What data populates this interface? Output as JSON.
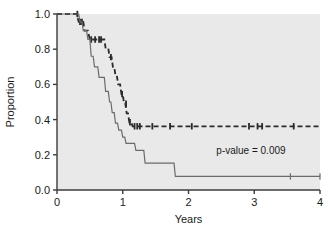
{
  "chart_data": {
    "type": "line",
    "title": "",
    "subtitle": "",
    "xlabel": "Years",
    "ylabel": "Proportion",
    "xlim": [
      0,
      4
    ],
    "ylim": [
      0,
      1
    ],
    "xticks": [
      "0",
      "1",
      "2",
      "3",
      "4"
    ],
    "xtick_values": [
      0,
      1,
      2,
      3,
      4
    ],
    "yticks": [
      "0.0",
      "0.2",
      "0.4",
      "0.6",
      "0.8",
      "1.0"
    ],
    "ytick_values": [
      0,
      0.2,
      0.4,
      0.6,
      0.8,
      1.0
    ],
    "grid": false,
    "legend": "none",
    "plot_background": "#e9e9e9",
    "figure_background": "#ffffff",
    "axis_color": "#3c3c3c",
    "annotations": [
      {
        "name": "p-value-annotation",
        "text": "p-value = 0.009",
        "x": 2.95,
        "y": 0.205
      }
    ],
    "series": [
      {
        "name": "group-upper-dashed",
        "style": "dashed",
        "color": "#2a2a2a",
        "step_points": [
          [
            0.0,
            1.0
          ],
          [
            0.3,
            1.0
          ],
          [
            0.33,
            0.955
          ],
          [
            0.4,
            0.955
          ],
          [
            0.42,
            0.905
          ],
          [
            0.47,
            0.905
          ],
          [
            0.5,
            0.855
          ],
          [
            0.72,
            0.855
          ],
          [
            0.74,
            0.805
          ],
          [
            0.78,
            0.805
          ],
          [
            0.8,
            0.755
          ],
          [
            0.83,
            0.755
          ],
          [
            0.85,
            0.7
          ],
          [
            0.87,
            0.7
          ],
          [
            0.89,
            0.65
          ],
          [
            0.91,
            0.65
          ],
          [
            0.93,
            0.6
          ],
          [
            0.96,
            0.6
          ],
          [
            0.98,
            0.545
          ],
          [
            1.0,
            0.545
          ],
          [
            1.02,
            0.49
          ],
          [
            1.04,
            0.49
          ],
          [
            1.06,
            0.435
          ],
          [
            1.08,
            0.435
          ],
          [
            1.1,
            0.385
          ],
          [
            1.13,
            0.385
          ],
          [
            1.15,
            0.362
          ],
          [
            4.0,
            0.362
          ]
        ],
        "censor_marks": [
          [
            0.31,
            1.0
          ],
          [
            0.35,
            0.955
          ],
          [
            0.38,
            0.955
          ],
          [
            0.52,
            0.855
          ],
          [
            0.58,
            0.855
          ],
          [
            0.64,
            0.855
          ],
          [
            0.67,
            0.855
          ],
          [
            0.82,
            0.755
          ],
          [
            0.99,
            0.545
          ],
          [
            1.05,
            0.49
          ],
          [
            1.11,
            0.385
          ],
          [
            1.18,
            0.362
          ],
          [
            1.22,
            0.362
          ],
          [
            1.26,
            0.362
          ],
          [
            1.45,
            0.362
          ],
          [
            1.72,
            0.362
          ],
          [
            2.05,
            0.362
          ],
          [
            2.92,
            0.362
          ],
          [
            3.05,
            0.362
          ],
          [
            3.12,
            0.362
          ],
          [
            3.6,
            0.362
          ]
        ]
      },
      {
        "name": "group-lower-solid",
        "style": "solid",
        "color": "#6b6b6b",
        "step_points": [
          [
            0.0,
            1.0
          ],
          [
            0.33,
            1.0
          ],
          [
            0.35,
            0.955
          ],
          [
            0.38,
            0.955
          ],
          [
            0.4,
            0.905
          ],
          [
            0.45,
            0.905
          ],
          [
            0.47,
            0.855
          ],
          [
            0.5,
            0.855
          ],
          [
            0.52,
            0.76
          ],
          [
            0.55,
            0.76
          ],
          [
            0.57,
            0.7
          ],
          [
            0.62,
            0.7
          ],
          [
            0.64,
            0.64
          ],
          [
            0.7,
            0.64
          ],
          [
            0.72,
            0.64
          ],
          [
            0.74,
            0.56
          ],
          [
            0.78,
            0.56
          ],
          [
            0.8,
            0.5
          ],
          [
            0.82,
            0.5
          ],
          [
            0.84,
            0.44
          ],
          [
            0.87,
            0.44
          ],
          [
            0.89,
            0.38
          ],
          [
            0.92,
            0.38
          ],
          [
            0.94,
            0.34
          ],
          [
            0.98,
            0.34
          ],
          [
            1.0,
            0.3
          ],
          [
            1.03,
            0.3
          ],
          [
            1.05,
            0.265
          ],
          [
            1.18,
            0.265
          ],
          [
            1.2,
            0.225
          ],
          [
            1.32,
            0.225
          ],
          [
            1.34,
            0.153
          ],
          [
            1.78,
            0.153
          ],
          [
            1.8,
            0.077
          ],
          [
            4.0,
            0.077
          ]
        ],
        "censor_marks": [
          [
            3.55,
            0.077
          ],
          [
            4.0,
            0.077
          ]
        ]
      }
    ]
  }
}
